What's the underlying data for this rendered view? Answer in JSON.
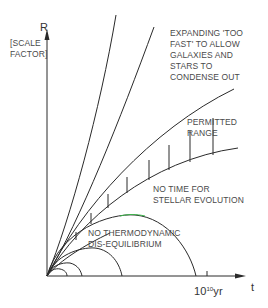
{
  "diagram": {
    "axes": {
      "y_label": "R",
      "y_sublabel_line1": "[SCALE",
      "y_sublabel_line2": "FACTOR]",
      "x_label": "t",
      "x_tick_base": "10",
      "x_tick_exp": "10",
      "x_tick_unit": "yr"
    },
    "regions": {
      "expanding_line1": "EXPANDING 'TOO",
      "expanding_line2": "FAST' TO ALLOW",
      "expanding_line3": "GALAXIES AND",
      "expanding_line4": "STARS TO",
      "expanding_line5": "CONDENSE OUT",
      "permitted_line1": "PERMITTED",
      "permitted_line2": "RANGE",
      "no_time_line1": "NO TIME FOR",
      "no_time_line2": "STELLAR EVOLUTION",
      "no_thermo_line1": "NO THERMODYNAMIC",
      "no_thermo_line2": "DIS-EQUILIBRIUM"
    },
    "colors": {
      "line": "#2a2a2a",
      "text": "#4a4a4a",
      "accent_green": "#3cb44b"
    }
  }
}
